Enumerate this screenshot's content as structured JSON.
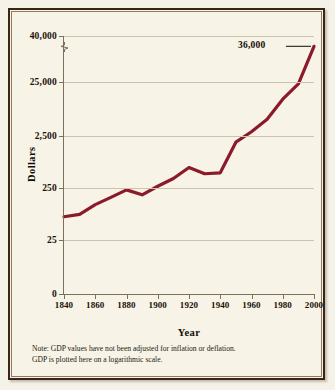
{
  "figure": {
    "background_color": "#f7f3e6",
    "frame_color": "#3b2417",
    "line_color": "#8B1A2B"
  },
  "axis_titles": {
    "y": "Dollars",
    "x": "Year"
  },
  "annotation": {
    "label": "36,000"
  },
  "note": {
    "line1": "Note: GDP values have not been adjusted for inflation or deflation.",
    "line2": "GDP is plotted here on a logarithmic scale."
  },
  "chart_data": {
    "type": "line",
    "title": "",
    "xlabel": "Year",
    "ylabel": "Dollars",
    "scale": "logarithmic",
    "grid": true,
    "legend": false,
    "axis_break": true,
    "xlim": [
      1840,
      2000
    ],
    "xticks": [
      1840,
      1860,
      1880,
      1900,
      1920,
      1940,
      1960,
      1980,
      2000
    ],
    "xticklabels": [
      "1840",
      "1860",
      "1880",
      "1900",
      "1920",
      "1940",
      "1960",
      "1980",
      "2000"
    ],
    "yticks": [
      0,
      25,
      250,
      2500,
      25000,
      40000
    ],
    "yticklabels": [
      "0",
      "25",
      "250",
      "2,500",
      "25,000",
      "40,000"
    ],
    "series": [
      {
        "name": "GDP per capita",
        "x": [
          1840,
          1850,
          1860,
          1870,
          1880,
          1890,
          1900,
          1910,
          1920,
          1930,
          1940,
          1950,
          1960,
          1970,
          1980,
          1990,
          2000
        ],
        "values": [
          70,
          78,
          120,
          165,
          230,
          185,
          270,
          380,
          620,
          470,
          490,
          1900,
          3000,
          5100,
          12000,
          23000,
          36000
        ]
      }
    ],
    "annotations": [
      {
        "x": 2000,
        "y": 36000,
        "text": "36,000"
      }
    ]
  }
}
